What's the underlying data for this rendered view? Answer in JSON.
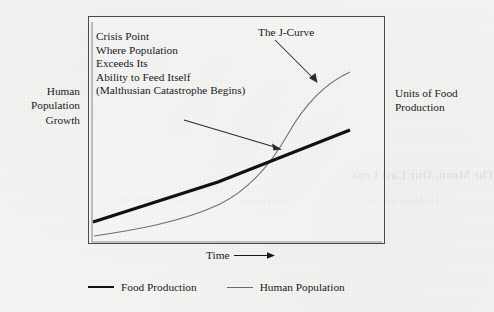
{
  "figure": {
    "left_axis_label": "Human\nPopulation\nGrowth",
    "right_axis_label": "Units of Food\nProduction",
    "x_axis_caption": "Time",
    "annotations": {
      "crisis_note": "Crisis Point\nWhere Population\nExceeds Its\nAbility to Feed Itself\n(Malthusian Catastrophe Begins)",
      "jcurve_label": "The J-Curve"
    },
    "legend": [
      {
        "label": "Food Production",
        "style": "thick",
        "color": "#121212"
      },
      {
        "label": "Human Population",
        "style": "thin",
        "color": "#6a6a6a"
      }
    ],
    "icons": {
      "x_axis_arrow": "arrow-right-icon",
      "crisis_arrow": "arrow-pointer-icon",
      "jcurve_arrow": "arrow-pointer-icon"
    },
    "bleed_through": [
      {
        "text": "The Moon, Our Last Lens",
        "x": 352,
        "y": 168,
        "size": 12
      },
      {
        "text": "Tod Papageorge Silver 1969",
        "x": 338,
        "y": 196,
        "size": 8,
        "light": true
      },
      {
        "text": "Food Production",
        "x": 120,
        "y": 192,
        "size": 11,
        "light": true
      },
      {
        "text": "Population",
        "x": 240,
        "y": 196,
        "size": 10,
        "light": true
      }
    ]
  },
  "chart_data": {
    "type": "line",
    "title": "",
    "xlabel": "Time",
    "ylabel": "Human Population Growth / Units of Food Production",
    "grid": false,
    "legend_position": "below",
    "axis_ranges": {
      "xlim": [
        0,
        100
      ],
      "ylim": [
        0,
        100
      ]
    },
    "annotations": [
      {
        "text": "Crisis Point Where Population Exceeds Its Ability to Feed Itself (Malthusian Catastrophe Begins)",
        "points_to": "intersection of Food Production and Human Population curves",
        "at": {
          "x": 65,
          "y": 42
        }
      },
      {
        "text": "The J-Curve",
        "points_to": "upper steep section of Human Population curve",
        "at": {
          "x": 88,
          "y": 80
        }
      }
    ],
    "series": [
      {
        "name": "Food Production",
        "style": "thick-straight-line",
        "color": "#121212",
        "x": [
          0,
          25,
          50,
          65,
          80,
          100
        ],
        "y": [
          9,
          21,
          33,
          40,
          48,
          58
        ]
      },
      {
        "name": "Human Population",
        "style": "thin-exponential-curve",
        "color": "#6a6a6a",
        "x": [
          0,
          20,
          40,
          55,
          65,
          75,
          85,
          100
        ],
        "y": [
          3,
          6,
          12,
          21,
          33,
          52,
          72,
          92
        ]
      }
    ],
    "intersection": {
      "x": 65,
      "y": 41,
      "label": "Crisis Point"
    }
  }
}
